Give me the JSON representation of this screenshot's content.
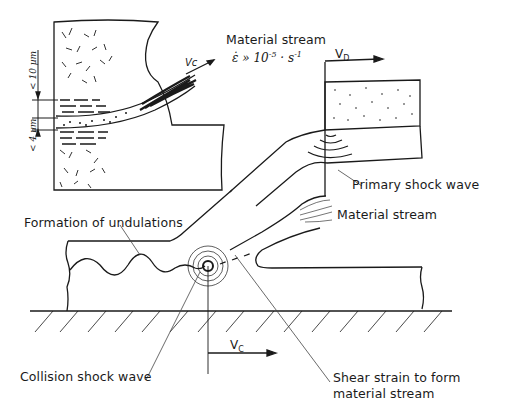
{
  "labels": {
    "material_stream_top": "Material stream",
    "strain_rate_symbol": "ε̇",
    "strain_rate_relation": "»",
    "strain_rate_base": "10",
    "strain_rate_exp": "-5",
    "strain_rate_unit": "· s",
    "strain_rate_unit_exp": "-1",
    "vd_label": "V",
    "vd_sub": "D",
    "vc_label": "V",
    "vc_sub": "C",
    "vc_inset": "Vc",
    "primary_shock_wave": "Primary shock wave",
    "material_stream_right": "Material stream",
    "formation_of_undulations": "Formation of undulations",
    "collision_shock_wave": "Collision shock wave",
    "shear_strain_line1": "Shear strain to form",
    "shear_strain_line2": "material stream",
    "scale_upper": "< 10 µm",
    "scale_lower": "< 4 µm"
  },
  "colors": {
    "ink": "#1a1a1a",
    "paper": "#ffffff",
    "leader": "#444444"
  }
}
